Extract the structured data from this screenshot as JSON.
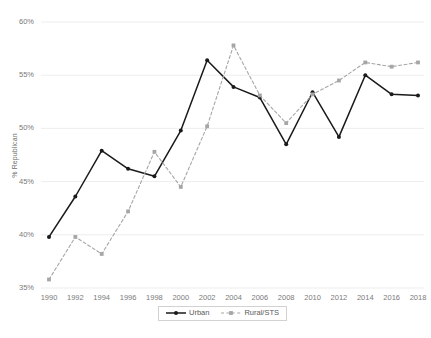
{
  "chart_data": {
    "type": "line",
    "title": "",
    "xlabel": "",
    "ylabel": "% Republican",
    "x": [
      1990,
      1992,
      1994,
      1996,
      1998,
      2000,
      2002,
      2004,
      2006,
      2008,
      2010,
      2012,
      2014,
      2016,
      2018
    ],
    "xticklabels": [
      "1990",
      "1992",
      "1994",
      "1996",
      "1998",
      "2000",
      "2002",
      "2004",
      "2006",
      "2008",
      "2010",
      "2012",
      "2014",
      "2016",
      "2018"
    ],
    "yticklabels": [
      "60%",
      "55%",
      "50%",
      "45%",
      "40%",
      "35%"
    ],
    "ytickvalues": [
      60,
      55,
      50,
      45,
      40,
      35
    ],
    "ylim": [
      35,
      60
    ],
    "xlim": [
      1990,
      2018
    ],
    "grid": "horizontal",
    "legend_position": "bottom-center",
    "series": [
      {
        "name": "Urban",
        "color": "#1a1a1a",
        "linestyle": "solid",
        "marker": "circle",
        "values": [
          39.8,
          43.6,
          47.9,
          46.2,
          45.5,
          49.8,
          56.4,
          53.9,
          52.9,
          48.5,
          53.4,
          49.2,
          55.0,
          53.2,
          53.1
        ]
      },
      {
        "name": "Rural/STS",
        "color": "#a6a6a6",
        "linestyle": "dashed",
        "marker": "square",
        "values": [
          35.8,
          39.8,
          38.2,
          42.2,
          47.8,
          44.5,
          50.2,
          57.8,
          53.1,
          50.5,
          53.2,
          54.5,
          56.2,
          55.8,
          56.2
        ]
      }
    ]
  },
  "legend": {
    "items": [
      {
        "label": "Urban"
      },
      {
        "label": "Rural/STS"
      }
    ]
  },
  "caption": {
    "text": ""
  },
  "colors": {
    "urban": "#1a1a1a",
    "rural": "#a6a6a6",
    "grid": "#ededed",
    "tick_text": "#7a7a7a",
    "axis_title": "#6e6e6e"
  }
}
